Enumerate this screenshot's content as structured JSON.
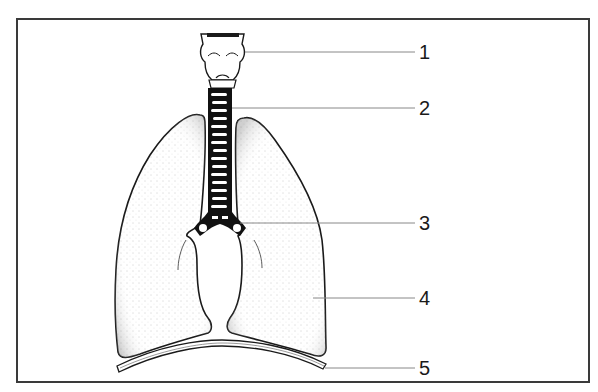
{
  "diagram": {
    "labels": [
      {
        "number": "1",
        "y": 52
      },
      {
        "number": "2",
        "y": 108
      },
      {
        "number": "3",
        "y": 223
      },
      {
        "number": "4",
        "y": 298
      },
      {
        "number": "5",
        "y": 368
      }
    ]
  },
  "colors": {
    "ink": "#1a1a1a",
    "frame": "#3a3a3a",
    "leader": "#888888",
    "background": "#ffffff"
  }
}
